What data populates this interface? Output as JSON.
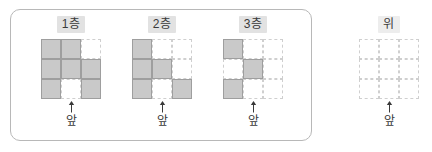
{
  "panel": {
    "border_color": "#b8b8b8",
    "corner_radius": "10px"
  },
  "colors": {
    "cube_fill": "#c9c9c9",
    "cube_stroke": "#9e9e9e",
    "empty_stroke": "#cfcfcf",
    "chip_background": "#e2e2e2",
    "text": "#3a3a3a"
  },
  "groups": [
    {
      "id": "floor-1",
      "title": "1층",
      "front_label": "앞",
      "arrow": "up-arrow-icon",
      "in_panel": true,
      "grid": [
        [
          1,
          1,
          0
        ],
        [
          1,
          1,
          1
        ],
        [
          1,
          0,
          1
        ]
      ]
    },
    {
      "id": "floor-2",
      "title": "2층",
      "front_label": "앞",
      "arrow": "up-arrow-icon",
      "in_panel": true,
      "grid": [
        [
          1,
          0,
          0
        ],
        [
          1,
          1,
          0
        ],
        [
          1,
          0,
          1
        ]
      ]
    },
    {
      "id": "floor-3",
      "title": "3층",
      "front_label": "앞",
      "arrow": "up-arrow-icon",
      "in_panel": true,
      "grid": [
        [
          1,
          0,
          0
        ],
        [
          0,
          1,
          0
        ],
        [
          1,
          0,
          0
        ]
      ]
    },
    {
      "id": "top-view",
      "title": "위",
      "front_label": "앞",
      "arrow": "up-arrow-icon",
      "in_panel": false,
      "grid": [
        [
          0,
          0,
          0
        ],
        [
          0,
          0,
          0
        ],
        [
          0,
          0,
          0
        ]
      ]
    }
  ]
}
